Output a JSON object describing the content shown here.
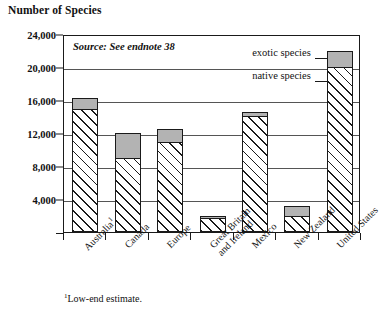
{
  "chart_data": {
    "type": "bar",
    "title": "Number of Species",
    "subtitle": "",
    "xlabel": "",
    "ylabel": "Number of Species",
    "ylim": [
      0,
      24000
    ],
    "ytick_step": 4000,
    "yticks": [
      "0",
      "4,000",
      "8,000",
      "12,000",
      "16,000",
      "20,000",
      "24,000"
    ],
    "ytick_values": [
      0,
      4000,
      8000,
      12000,
      16000,
      20000,
      24000
    ],
    "grid": true,
    "stacked": true,
    "legend_position": "inside-right",
    "categories": [
      "Australia",
      "Canada",
      "Europe",
      "Great Britain\nand Ireland",
      "Mexico",
      "New Zealand",
      "United States"
    ],
    "category_footnote_marks": [
      "1",
      "",
      "",
      "",
      "",
      "",
      ""
    ],
    "series": [
      {
        "name": "native species",
        "fill": "hatched",
        "values": [
          15000,
          9000,
          11000,
          1700,
          14100,
          2000,
          20000
        ]
      },
      {
        "name": "exotic species",
        "fill": "gray",
        "values": [
          1300,
          3000,
          1500,
          300,
          400,
          1200,
          2000
        ]
      }
    ],
    "totals": [
      16300,
      12000,
      12500,
      2000,
      14500,
      3200,
      22000
    ],
    "annotations": [
      "Source: See endnote 38",
      "1Low-end estimate."
    ]
  },
  "header": {
    "title": "Number of Species"
  },
  "source": {
    "text": "Source: See endnote 38"
  },
  "legend": {
    "exotic_label": "exotic species",
    "native_label": "native species"
  },
  "footnote": {
    "marker": "1",
    "text": "Low-end estimate."
  },
  "colors": {
    "exotic_fill": "#b3b3b3",
    "native_fill": "#ffffff",
    "hatch_stroke": "#1a1a1a",
    "axis": "#1a1a1a",
    "gridline": "#555555",
    "background": "#ffffff"
  }
}
